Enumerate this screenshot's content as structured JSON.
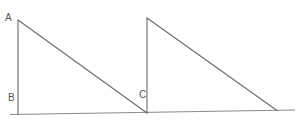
{
  "diagram": {
    "title": "",
    "colors": {
      "line": "#6a6a6a",
      "baseline": "#8a8a8a",
      "label": "#555555",
      "background": "#ffffff"
    },
    "labels": [
      {
        "id": "A",
        "text": "A",
        "x": 5,
        "y": 21
      },
      {
        "id": "B",
        "text": "B",
        "x": 8,
        "y": 101
      },
      {
        "id": "C",
        "text": "C",
        "x": 139,
        "y": 98
      }
    ],
    "points": {
      "A": [
        18,
        20
      ],
      "B": [
        18,
        114
      ],
      "C": [
        147,
        113
      ],
      "D": [
        147,
        18
      ],
      "E": [
        277,
        110
      ]
    },
    "shapes": [
      {
        "name": "triangle-abc",
        "vertices": [
          "A",
          "B",
          "C"
        ]
      },
      {
        "name": "triangle-cde",
        "vertices": [
          "D",
          "C",
          "E"
        ]
      }
    ],
    "baseline": {
      "from": [
        10,
        114
      ],
      "to": [
        295,
        110
      ]
    }
  }
}
